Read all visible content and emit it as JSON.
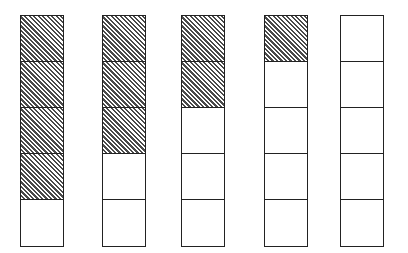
{
  "diagram": {
    "type": "fraction-bars",
    "cells_per_bar": 5,
    "colors": {
      "line": "#222222",
      "hatch": "#4a4a4a",
      "background": "#ffffff"
    },
    "bars": [
      {
        "label": "bar-1",
        "shaded": 4,
        "total": 5,
        "left": 20
      },
      {
        "label": "bar-2",
        "shaded": 3,
        "total": 5,
        "left": 102
      },
      {
        "label": "bar-3",
        "shaded": 2,
        "total": 5,
        "left": 181
      },
      {
        "label": "bar-4",
        "shaded": 1,
        "total": 5,
        "left": 264
      },
      {
        "label": "bar-5",
        "shaded": 0,
        "total": 5,
        "left": 340
      }
    ]
  }
}
